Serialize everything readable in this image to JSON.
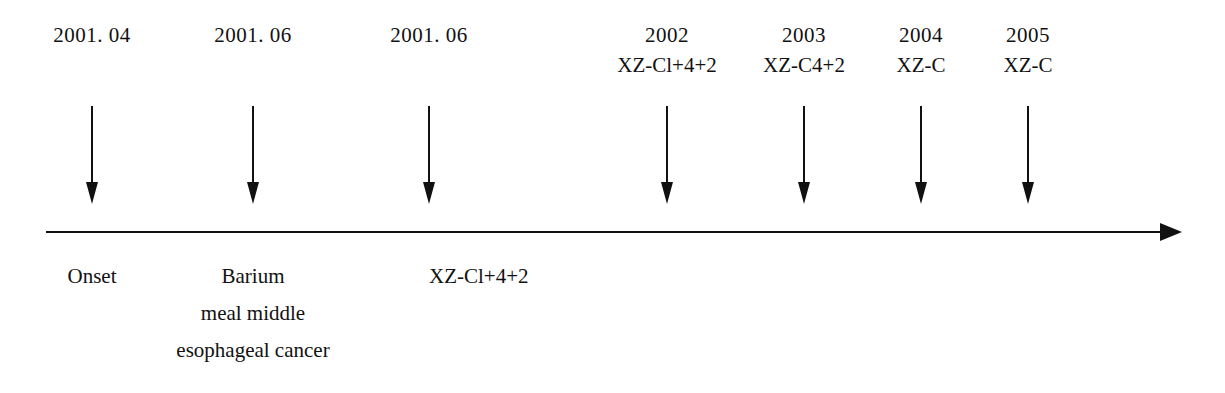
{
  "figure": {
    "type": "timeline",
    "orientation": "horizontal-left-to-right",
    "axis": {
      "name": "timeline-axis",
      "has_end_arrow": true
    },
    "colors": {
      "ink": "#111111",
      "background": "#ffffff"
    }
  },
  "markers": [
    {
      "id": "marker-2001-04",
      "date": "2001. 04",
      "code": "",
      "x": 92,
      "below": [
        "Onset"
      ],
      "below_align": "center"
    },
    {
      "id": "marker-2001-06-a",
      "date": "2001. 06",
      "code": "",
      "x": 253,
      "below": [
        "Barium",
        "meal middle",
        "esophageal cancer"
      ],
      "below_align": "center"
    },
    {
      "id": "marker-2001-06-b",
      "date": "2001. 06",
      "code": "",
      "x": 429,
      "below": [
        "XZ-Cl+4+2"
      ],
      "below_align": "left"
    },
    {
      "id": "marker-2002",
      "date": "2002",
      "code": "XZ-Cl+4+2",
      "x": 667,
      "below": [],
      "below_align": "center"
    },
    {
      "id": "marker-2003",
      "date": "2003",
      "code": "XZ-C4+2",
      "x": 804,
      "below": [],
      "below_align": "center"
    },
    {
      "id": "marker-2004",
      "date": "2004",
      "code": "XZ-C",
      "x": 921,
      "below": [],
      "below_align": "center"
    },
    {
      "id": "marker-2005",
      "date": "2005",
      "code": "XZ-C",
      "x": 1028,
      "below": [],
      "below_align": "center"
    }
  ]
}
